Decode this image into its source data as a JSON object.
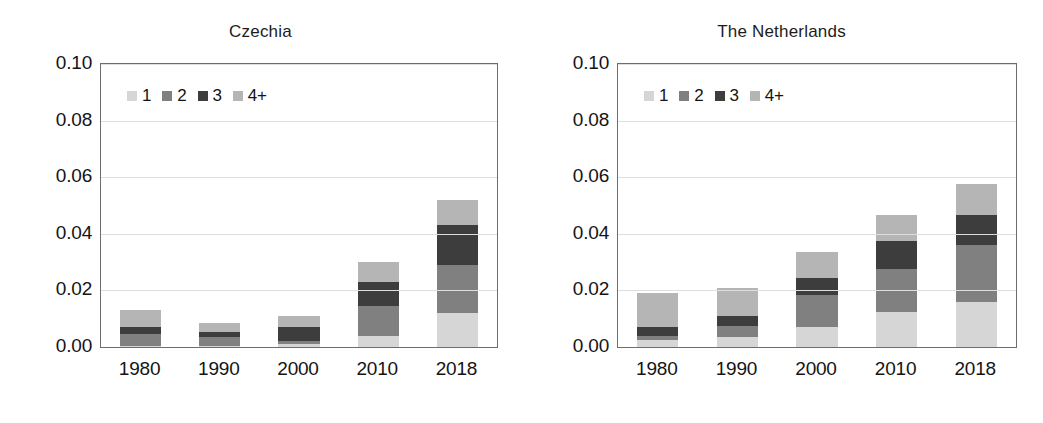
{
  "figure": {
    "width": 1043,
    "height": 423,
    "background": "#ffffff"
  },
  "series_colors": {
    "1": "#d6d6d6",
    "2": "#808080",
    "3": "#3d3d3d",
    "4+": "#b5b5b5"
  },
  "axis": {
    "ylim": [
      0.0,
      0.1
    ],
    "yticks": [
      0.0,
      0.02,
      0.04,
      0.06,
      0.08,
      0.1
    ],
    "ytick_labels": [
      "0.00",
      "0.02",
      "0.04",
      "0.06",
      "0.08",
      "0.10"
    ],
    "xtick_labels": [
      "1980",
      "1990",
      "2000",
      "2010",
      "2018"
    ],
    "grid": true,
    "xlabel": "",
    "ylabel": ""
  },
  "legend": {
    "position": "top-left inside axes",
    "entries": [
      {
        "label": "1",
        "color": "#d6d6d6"
      },
      {
        "label": "2",
        "color": "#808080"
      },
      {
        "label": "3",
        "color": "#3d3d3d"
      },
      {
        "label": "4+",
        "color": "#b5b5b5"
      }
    ]
  },
  "panels": [
    {
      "title": "Czechia"
    },
    {
      "title": "The Netherlands"
    }
  ],
  "chart_data": [
    {
      "type": "bar",
      "stacked": true,
      "title": "Czechia",
      "xlabel": "",
      "ylabel": "",
      "ylim": [
        0.0,
        0.1
      ],
      "yticks": [
        0.0,
        0.02,
        0.04,
        0.06,
        0.08,
        0.1
      ],
      "grid": true,
      "legend_position": "upper left",
      "categories": [
        "1980",
        "1990",
        "2000",
        "2010",
        "2018"
      ],
      "series": [
        {
          "name": "1",
          "color": "#d6d6d6",
          "values": [
            0.0002,
            0.0002,
            0.001,
            0.004,
            0.012
          ]
        },
        {
          "name": "2",
          "color": "#808080",
          "values": [
            0.0045,
            0.0035,
            0.001,
            0.0105,
            0.017
          ]
        },
        {
          "name": "3",
          "color": "#3d3d3d",
          "values": [
            0.0025,
            0.0015,
            0.005,
            0.0085,
            0.014
          ]
        },
        {
          "name": "4+",
          "color": "#b5b5b5",
          "values": [
            0.006,
            0.0033,
            0.004,
            0.007,
            0.009
          ]
        }
      ],
      "totals": [
        0.0132,
        0.0085,
        0.011,
        0.03,
        0.052
      ]
    },
    {
      "type": "bar",
      "stacked": true,
      "title": "The Netherlands",
      "xlabel": "",
      "ylabel": "",
      "ylim": [
        0.0,
        0.1
      ],
      "yticks": [
        0.0,
        0.02,
        0.04,
        0.06,
        0.08,
        0.1
      ],
      "grid": true,
      "legend_position": "upper left",
      "categories": [
        "1980",
        "1990",
        "2000",
        "2010",
        "2018"
      ],
      "series": [
        {
          "name": "1",
          "color": "#d6d6d6",
          "values": [
            0.0025,
            0.0035,
            0.007,
            0.0125,
            0.016
          ]
        },
        {
          "name": "2",
          "color": "#808080",
          "values": [
            0.0015,
            0.004,
            0.0115,
            0.015,
            0.02
          ]
        },
        {
          "name": "3",
          "color": "#3d3d3d",
          "values": [
            0.003,
            0.0035,
            0.006,
            0.01,
            0.0105
          ]
        },
        {
          "name": "4+",
          "color": "#b5b5b5",
          "values": [
            0.012,
            0.01,
            0.009,
            0.009,
            0.011
          ]
        }
      ],
      "totals": [
        0.019,
        0.021,
        0.0335,
        0.0465,
        0.0575
      ]
    }
  ]
}
